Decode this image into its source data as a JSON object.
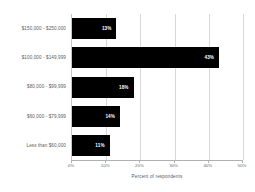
{
  "chart_data": {
    "type": "bar",
    "orientation": "horizontal",
    "title": "",
    "xlabel": "Percent of respondents",
    "ylabel": "",
    "categories": [
      "$150,000 - $250,000",
      "$100,000 - $149,999",
      "$80,000 - $99,999",
      "$60,000 - $79,999",
      "Less than $60,000"
    ],
    "values": [
      13,
      43,
      18,
      14,
      11
    ],
    "data_labels": [
      "13%",
      "43%",
      "18%",
      "14%",
      "11%"
    ],
    "xlim": [
      0,
      50
    ],
    "xticks": [
      0,
      10,
      20,
      30,
      40,
      50
    ],
    "xticklabels": [
      "0%",
      "10%",
      "20%",
      "30%",
      "40%",
      "50%"
    ],
    "grid": true,
    "grid_axis": "x",
    "legend": false,
    "bar_color": "#000000",
    "label_color": "#ffffff",
    "grid_color": "#d8d8d8",
    "background": "#ffffff"
  }
}
